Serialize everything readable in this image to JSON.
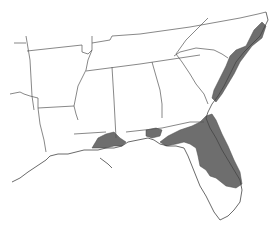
{
  "map": {
    "type": "species range map",
    "region": "Southeastern United States",
    "states_shown": [
      "Arkansas",
      "Tennessee",
      "North Carolina",
      "Louisiana",
      "Mississippi",
      "Alabama",
      "Georgia",
      "South Carolina",
      "Florida",
      "Texas",
      "Oklahoma",
      "Missouri",
      "Kentucky",
      "Virginia"
    ],
    "legend": [],
    "colors": {
      "background": "#ffffff",
      "borders": "#555555",
      "range_fill": "#6e6e6e"
    },
    "shaded_ranges": [
      {
        "name": "atlantic-coastal-plain",
        "description": "Coastal North Carolina south through South Carolina and Georgia coast"
      },
      {
        "name": "florida-peninsula",
        "description": "Most of peninsular Florida and northeast Florida / southeast Georgia"
      },
      {
        "name": "florida-panhandle",
        "description": "Florida panhandle Gulf coast"
      },
      {
        "name": "gulf-coast-ms-al",
        "description": "Coastal Mississippi and Alabama around Mobile Bay"
      }
    ]
  }
}
